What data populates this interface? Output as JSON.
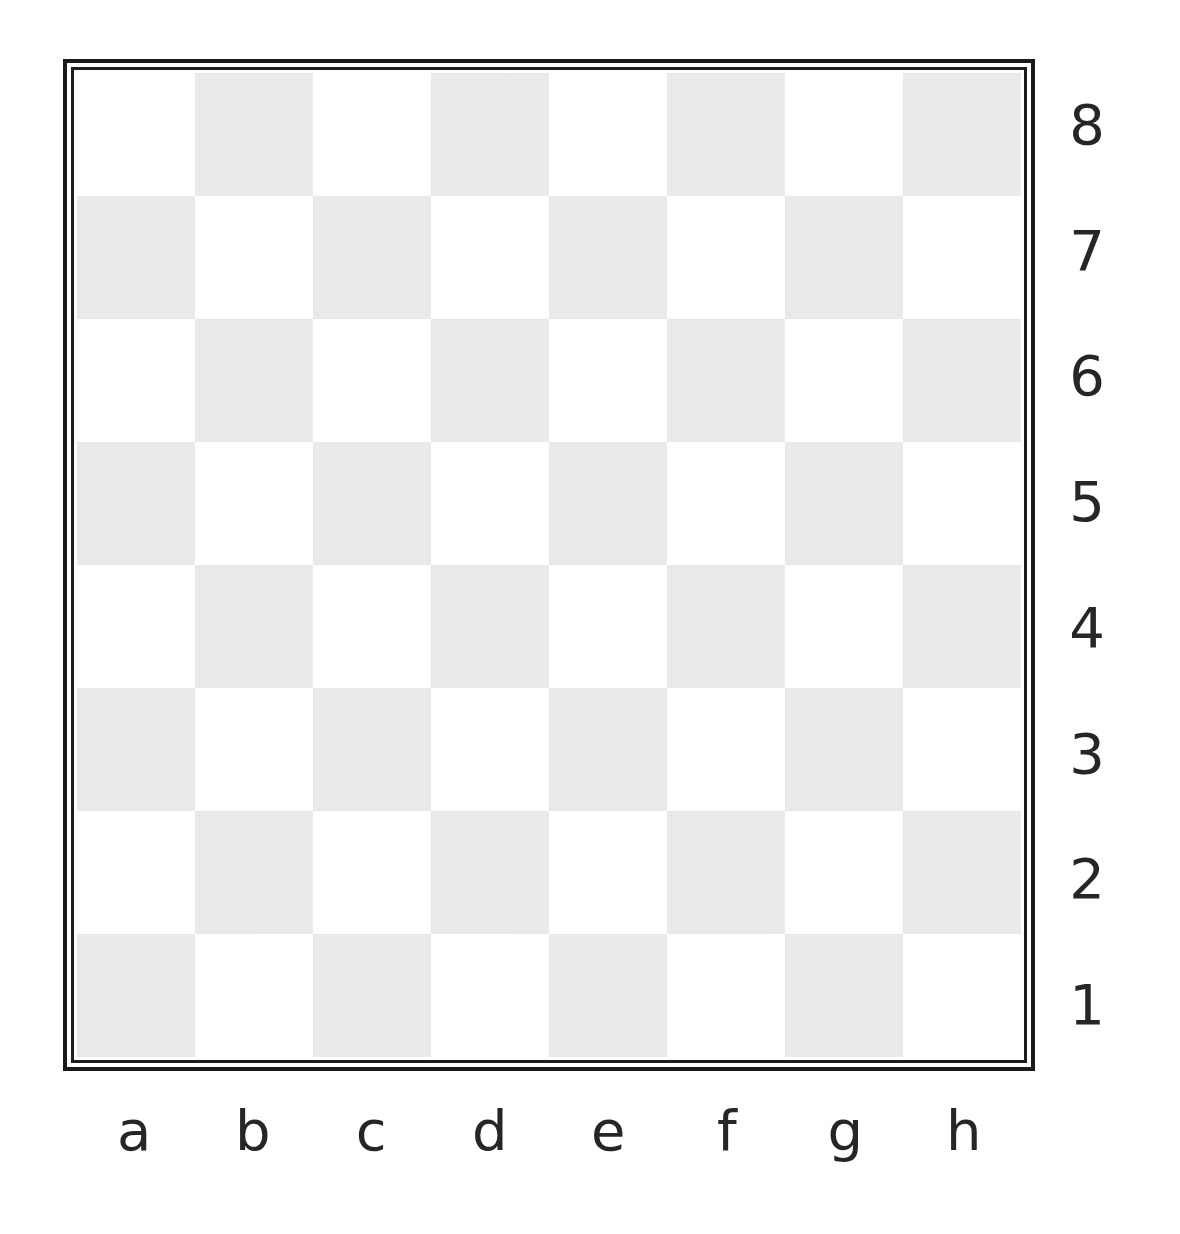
{
  "diagram": {
    "type": "chessboard",
    "orientation": "white-at-bottom",
    "board_size": 8,
    "pieces": [],
    "colors": {
      "light_square": "#ffffff",
      "dark_square": "#efefef",
      "border": "#1a1a1a",
      "label_text": "#262626",
      "background": "#ffffff"
    },
    "files": [
      "a",
      "b",
      "c",
      "d",
      "e",
      "f",
      "g",
      "h"
    ],
    "ranks": [
      "8",
      "7",
      "6",
      "5",
      "4",
      "3",
      "2",
      "1"
    ],
    "squares": [
      [
        "light",
        "dark",
        "light",
        "dark",
        "light",
        "dark",
        "light",
        "dark"
      ],
      [
        "dark",
        "light",
        "dark",
        "light",
        "dark",
        "light",
        "dark",
        "light"
      ],
      [
        "light",
        "dark",
        "light",
        "dark",
        "light",
        "dark",
        "light",
        "dark"
      ],
      [
        "dark",
        "light",
        "dark",
        "light",
        "dark",
        "light",
        "dark",
        "light"
      ],
      [
        "light",
        "dark",
        "light",
        "dark",
        "light",
        "dark",
        "light",
        "dark"
      ],
      [
        "dark",
        "light",
        "dark",
        "light",
        "dark",
        "light",
        "dark",
        "light"
      ],
      [
        "light",
        "dark",
        "light",
        "dark",
        "light",
        "dark",
        "light",
        "dark"
      ],
      [
        "dark",
        "light",
        "dark",
        "light",
        "dark",
        "light",
        "dark",
        "light"
      ]
    ]
  }
}
